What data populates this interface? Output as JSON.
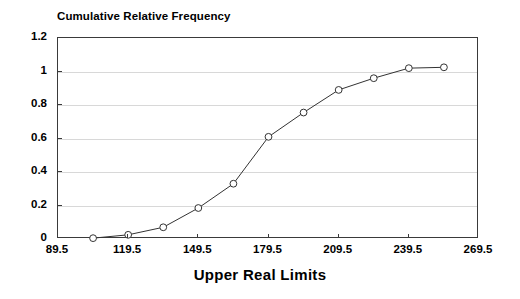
{
  "chart_data": {
    "type": "line",
    "title": "Cumulative Relative Frequency",
    "subtitle": "",
    "xlabel": "Upper Real Limits",
    "ylabel": "",
    "x": [
      104.5,
      119.5,
      134.5,
      149.5,
      164.5,
      179.5,
      194.5,
      209.5,
      224.5,
      239.5,
      254.5
    ],
    "values": [
      0.005,
      0.025,
      0.07,
      0.185,
      0.33,
      0.61,
      0.755,
      0.89,
      0.96,
      1.02,
      1.025
    ],
    "series": [
      {
        "name": "Cumulative Relative Frequency",
        "values": [
          0.005,
          0.025,
          0.07,
          0.185,
          0.33,
          0.61,
          0.755,
          0.89,
          0.96,
          1.02,
          1.025
        ]
      }
    ],
    "xlim": [
      89.5,
      269.5
    ],
    "ylim": [
      0,
      1.2
    ],
    "xticks": [
      "89.5",
      "119.5",
      "149.5",
      "179.5",
      "209.5",
      "239.5",
      "269.5"
    ],
    "xtick_values": [
      89.5,
      119.5,
      149.5,
      179.5,
      209.5,
      239.5,
      269.5
    ],
    "yticks": [
      "0",
      "0.2",
      "0.4",
      "0.6",
      "0.8",
      "1",
      "1.2"
    ],
    "ytick_values": [
      0,
      0.2,
      0.4,
      0.6,
      0.8,
      1,
      1.2
    ],
    "grid": "horizontal",
    "legend": "none",
    "marker": "open-circle",
    "line_color": "#333333",
    "marker_color": "#333333",
    "grid_color": "#d8d8d8",
    "axis_color": "#3a3a3a",
    "background_color": "#ffffff"
  }
}
